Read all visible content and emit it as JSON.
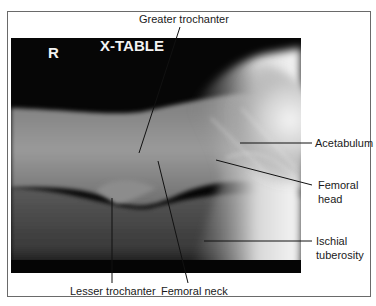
{
  "figure": {
    "type": "radiograph",
    "view_marker": "X-TABLE",
    "side_marker": "R"
  },
  "labels": [
    {
      "id": "greater-trochanter",
      "text": "Greater trochanter"
    },
    {
      "id": "acetabulum",
      "text": "Acetabulum"
    },
    {
      "id": "femoral-head",
      "line1": "Femoral",
      "line2": "head"
    },
    {
      "id": "ischial-tuberosity",
      "line1": "Ischial",
      "line2": "tuberosity"
    },
    {
      "id": "lesser-trochanter",
      "text": "Lesser trochanter"
    },
    {
      "id": "femoral-neck",
      "text": "Femoral neck"
    }
  ],
  "colors": {
    "frame_border": "#6a6a6a",
    "label_text": "#1a1a1a",
    "leader_line": "#111111",
    "marker_text": "#f2f2f2"
  }
}
